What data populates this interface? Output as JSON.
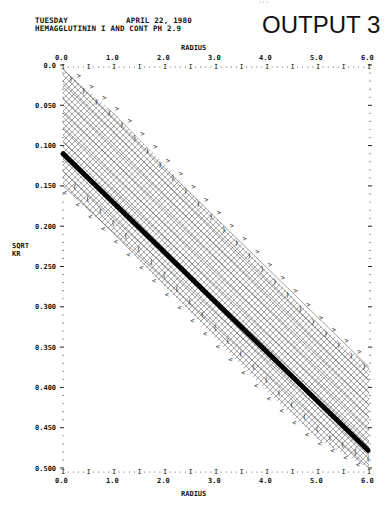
{
  "header": {
    "day": "TUESDAY",
    "date": "APRIL 22, 1980",
    "subtitle": "HEMAGGLUTININ I AND CONT PH 2.9",
    "output_label": "OUTPUT 3",
    "faded_top_text": "..."
  },
  "chart_data": {
    "type": "line",
    "title": "HEMAGGLUTININ I AND CONT PH 2.9",
    "xlabel": "RADIUS",
    "ylabel": "SQRT KR",
    "x_ticks": [
      "0.0",
      "1.0",
      "2.0",
      "3.0",
      "4.0",
      "5.0",
      "6.0"
    ],
    "y_ticks": [
      "0.0",
      "0.050",
      "0.100",
      "0.150",
      "0.200",
      "0.250",
      "0.300",
      "0.350",
      "0.400",
      "0.450",
      "0.500"
    ],
    "xlim": [
      0.0,
      6.0
    ],
    "ylim": [
      0.0,
      0.5
    ],
    "y_inverted": true,
    "grid": false,
    "series": [
      {
        "name": "fit line",
        "x": [
          0.0,
          6.0
        ],
        "values": [
          0.11,
          0.478
        ]
      },
      {
        "name": "upper confidence band",
        "x": [
          0.0,
          1.0,
          2.0,
          3.0,
          4.0,
          5.0,
          6.0
        ],
        "values": [
          0.005,
          0.06,
          0.125,
          0.19,
          0.255,
          0.32,
          0.375
        ]
      },
      {
        "name": "lower confidence band",
        "x": [
          0.0,
          1.0,
          2.0,
          3.0,
          4.0,
          5.0,
          6.0
        ],
        "values": [
          0.15,
          0.21,
          0.275,
          0.34,
          0.405,
          0.465,
          0.5
        ]
      }
    ],
    "markers": {
      "upper": ">",
      "upper_inner": ")",
      "lower": "<",
      "lower_inner": "("
    },
    "legend": null
  }
}
